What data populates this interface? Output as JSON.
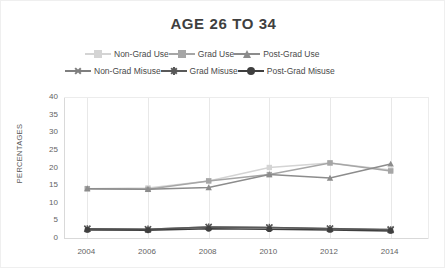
{
  "chart_data": {
    "type": "line",
    "title": "AGE 26 TO 34",
    "xlabel": "",
    "ylabel": "PERCENTAGES",
    "x": [
      2004,
      2006,
      2008,
      2010,
      2012,
      2014
    ],
    "categories": [
      "2004",
      "2006",
      "2008",
      "2010",
      "2012",
      "2014"
    ],
    "xticks": [
      "2004",
      "2006",
      "2008",
      "2010",
      "2012",
      "2014"
    ],
    "yticks": [
      "0",
      "5",
      "10",
      "15",
      "20",
      "25",
      "30",
      "35",
      "40"
    ],
    "ylim": [
      0,
      40
    ],
    "ystep": 5,
    "grid": "vertical",
    "legend_position": "top",
    "series": [
      {
        "name": "Non-Grad Use",
        "marker": "square",
        "color": "#d4d4d4",
        "values": [
          14.0,
          14.2,
          16.2,
          20.0,
          21.3,
          19.3
        ]
      },
      {
        "name": "Grad Use",
        "marker": "square",
        "color": "#a6a6a6",
        "values": [
          14.0,
          13.8,
          16.2,
          18.0,
          21.3,
          19.0
        ]
      },
      {
        "name": "Post-Grad Use",
        "marker": "triangle",
        "color": "#8c8c8c",
        "values": [
          14.0,
          13.8,
          14.3,
          18.0,
          17.0,
          21.0
        ]
      },
      {
        "name": "Non-Grad Misuse",
        "marker": "x",
        "color": "#7f7f7f",
        "values": [
          2.6,
          2.5,
          3.1,
          3.0,
          2.6,
          2.5
        ]
      },
      {
        "name": "Grad Misuse",
        "marker": "star",
        "color": "#595959",
        "values": [
          2.6,
          2.5,
          3.1,
          3.0,
          2.7,
          2.3
        ]
      },
      {
        "name": "Post-Grad Misuse",
        "marker": "circle",
        "color": "#3f3f3f",
        "values": [
          2.3,
          2.2,
          2.6,
          2.5,
          2.3,
          2.0
        ]
      }
    ]
  }
}
